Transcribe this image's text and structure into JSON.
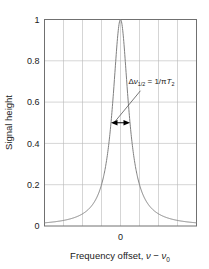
{
  "chart_data": {
    "type": "line",
    "title": "",
    "subtitle": "",
    "xlabel_parts": {
      "lead": "Frequency offset, ",
      "nu1": "ν",
      "minus": " − ",
      "nu2": "ν",
      "nu2_sub": "0"
    },
    "xlabel": "Frequency offset, ν − ν0",
    "ylabel": "Signal height",
    "xlim": [
      -8,
      8
    ],
    "ylim": [
      0,
      1
    ],
    "xticks": [
      0
    ],
    "xtick_labels": [
      "0"
    ],
    "yticks": [
      0,
      0.2,
      0.4,
      0.6,
      0.8,
      1
    ],
    "ytick_labels": [
      "0",
      "0.2",
      "0.4",
      "0.6",
      "0.8",
      "1"
    ],
    "grid": true,
    "grid_x_count": 7,
    "grid_y_count": 4,
    "legend": "none",
    "series": [
      {
        "name": "Lorentzian lineshape",
        "color": "#808080",
        "function": "lorentzian",
        "half_width_at_half_max": 1.0,
        "peak_x": 0,
        "peak_y": 1,
        "x": [
          -8,
          -7.5,
          -7,
          -6.5,
          -6,
          -5.5,
          -5,
          -4.5,
          -4,
          -3.5,
          -3,
          -2.75,
          -2.5,
          -2.25,
          -2,
          -1.75,
          -1.5,
          -1.25,
          -1,
          -0.875,
          -0.75,
          -0.625,
          -0.5,
          -0.375,
          -0.25,
          -0.125,
          0,
          0.125,
          0.25,
          0.375,
          0.5,
          0.625,
          0.75,
          0.875,
          1,
          1.25,
          1.5,
          1.75,
          2,
          2.25,
          2.5,
          2.75,
          3,
          3.5,
          4,
          4.5,
          5,
          5.5,
          6,
          6.5,
          7,
          7.5,
          8
        ],
        "y": [
          0.0154,
          0.0175,
          0.02,
          0.0231,
          0.027,
          0.032,
          0.0385,
          0.0471,
          0.0588,
          0.0755,
          0.1,
          0.1168,
          0.1379,
          0.1648,
          0.2,
          0.2462,
          0.3077,
          0.3902,
          0.5,
          0.5664,
          0.64,
          0.7191,
          0.8,
          0.8767,
          0.9412,
          0.9846,
          1.0,
          0.9846,
          0.9412,
          0.8767,
          0.8,
          0.7191,
          0.64,
          0.5664,
          0.5,
          0.3902,
          0.3077,
          0.2462,
          0.2,
          0.1648,
          0.1379,
          0.1168,
          0.1,
          0.0755,
          0.0588,
          0.0471,
          0.0385,
          0.032,
          0.027,
          0.0231,
          0.02,
          0.0175,
          0.0154
        ]
      }
    ],
    "annotations": [
      {
        "name": "fwhm-arrow",
        "type": "double-arrow",
        "y": 0.5,
        "x_start": -1,
        "x_end": 1,
        "label_parts": {
          "delta": "Δ",
          "nu": "ν",
          "nu_sub": "1/2",
          "equals": " = 1/",
          "pi": "π",
          "T": "T",
          "T_sub": "2"
        },
        "label": "Δν1/2 = 1/πT2",
        "label_x": 2.1,
        "label_y": 0.655
      }
    ],
    "colors": {
      "curve": "#808080",
      "grid": "#b8b8b8",
      "frame": "#707070",
      "text": "#1a1a1a",
      "annotation": "#000000",
      "background": "#ffffff"
    }
  }
}
